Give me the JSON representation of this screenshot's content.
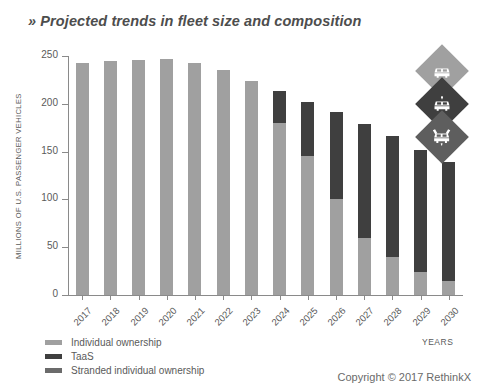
{
  "title": "» Projected trends in fleet size and composition",
  "footer": {
    "copyright": "Copyright © 2017 RethinkX"
  },
  "colors": {
    "individual": "#a0a0a0",
    "taas": "#3f3f3f",
    "stranded": "#6b6b6b",
    "axis": "#8a8a8a",
    "text": "#5a5a5a"
  },
  "badges": [
    {
      "name": "individual-vehicle-badge",
      "icon": "car-icon"
    },
    {
      "name": "taas-vehicle-badge",
      "icon": "robotaxi-icon"
    },
    {
      "name": "stranded-vehicle-badge",
      "icon": "stranded-car-icon"
    }
  ],
  "chart_data": {
    "type": "bar",
    "subtype": "stacked",
    "title": "Projected trends in fleet size and composition",
    "xlabel": "YEARS",
    "ylabel": "MILLIONS OF U.S. PASSENGER VEHICLES",
    "ylim": [
      0,
      250
    ],
    "yticks": [
      0,
      50,
      100,
      150,
      200,
      250
    ],
    "grid": false,
    "legend_position": "bottom-left",
    "categories": [
      "2017",
      "2018",
      "2019",
      "2020",
      "2021",
      "2022",
      "2023",
      "2024",
      "2025",
      "2026",
      "2027",
      "2028",
      "2029",
      "2030"
    ],
    "series": [
      {
        "name": "Individual ownership",
        "color": "#a0a0a0",
        "values": [
          243,
          245,
          246,
          247,
          243,
          235,
          224,
          180,
          145,
          100,
          60,
          40,
          24,
          15
        ]
      },
      {
        "name": "TaaS",
        "color": "#3f3f3f",
        "values": [
          0,
          0,
          0,
          0,
          0,
          0,
          0,
          33,
          57,
          91,
          119,
          126,
          128,
          124
        ]
      },
      {
        "name": "Stranded individual ownership",
        "color": "#6b6b6b",
        "values": [
          0,
          0,
          0,
          0,
          0,
          0,
          0,
          0,
          0,
          0,
          0,
          0,
          0,
          0
        ]
      }
    ],
    "totals": [
      243,
      245,
      246,
      247,
      243,
      235,
      224,
      213,
      202,
      191,
      179,
      166,
      152,
      139
    ]
  }
}
